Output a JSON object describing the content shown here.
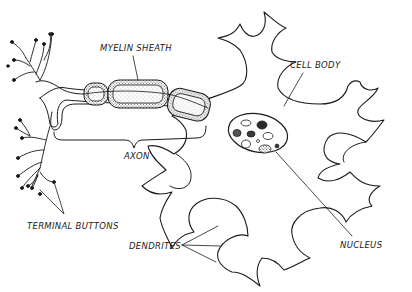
{
  "diagram": {
    "labels": {
      "myelin_sheath": "MYELIN SHEATH",
      "cell_body": "CELL BODY",
      "axon": "AXON",
      "terminal_buttons": "TERMINAL BUTTONS",
      "dendrites": "DENDRITES",
      "nucleus": "NUCLEUS"
    },
    "colors": {
      "ink": "#1a1a1a",
      "stipple": "#6b6b6b",
      "background": "#ffffff"
    }
  }
}
